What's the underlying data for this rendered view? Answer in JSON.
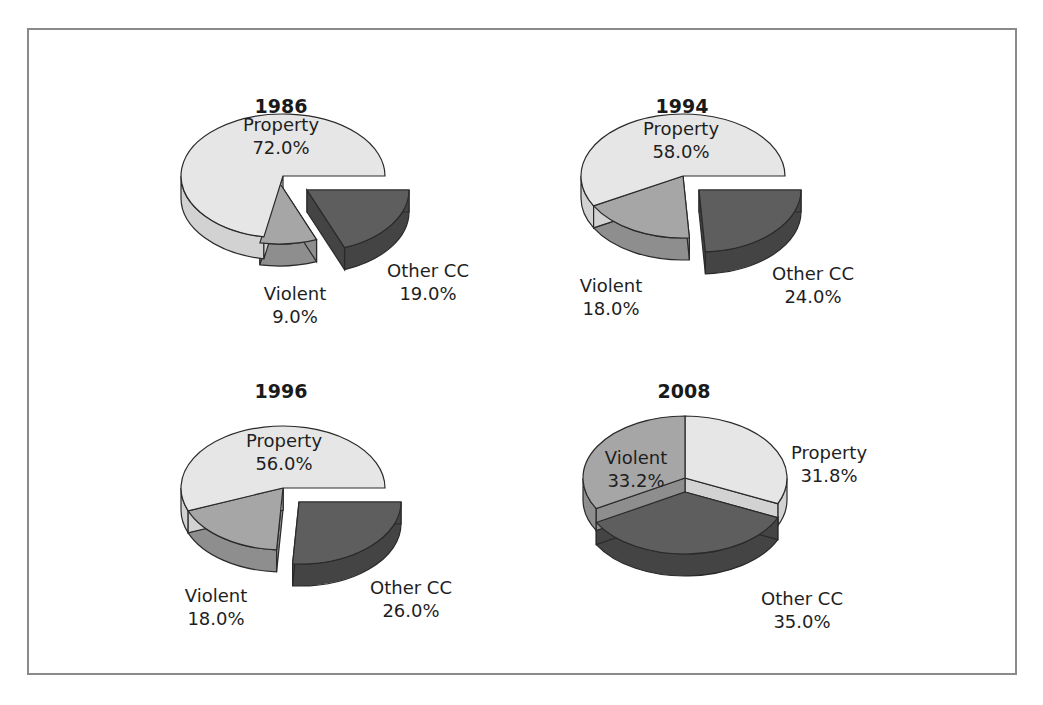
{
  "colors": {
    "property_top": "#e6e6e6",
    "property_side": "#d2d2d2",
    "violent_top": "#a6a6a6",
    "violent_side": "#8e8e8e",
    "other_top": "#5e5e5e",
    "other_side": "#444444",
    "outline": "#2a2a2a",
    "frame": "#8a8a8a"
  },
  "chart_data": [
    {
      "type": "pie",
      "title": "1986",
      "categories": [
        "Property",
        "Violent",
        "Other CC"
      ],
      "values": [
        72.0,
        9.0,
        19.0
      ],
      "labels": [
        "Property\n72.0%",
        "Violent\n9.0%",
        "Other CC\n19.0%"
      ],
      "exploded": [
        "Other CC"
      ],
      "style": "3d"
    },
    {
      "type": "pie",
      "title": "1994",
      "categories": [
        "Property",
        "Violent",
        "Other CC"
      ],
      "values": [
        58.0,
        18.0,
        24.0
      ],
      "labels": [
        "Property\n58.0%",
        "Violent\n18.0%",
        "Other CC\n24.0%"
      ],
      "exploded": [
        "Other CC"
      ],
      "style": "3d"
    },
    {
      "type": "pie",
      "title": "1996",
      "categories": [
        "Property",
        "Violent",
        "Other CC"
      ],
      "values": [
        56.0,
        18.0,
        26.0
      ],
      "labels": [
        "Property\n56.0%",
        "Violent\n18.0%",
        "Other CC\n26.0%"
      ],
      "exploded": [
        "Other CC"
      ],
      "style": "3d"
    },
    {
      "type": "pie",
      "title": "2008",
      "categories": [
        "Property",
        "Violent",
        "Other CC"
      ],
      "values": [
        31.8,
        33.2,
        35.0
      ],
      "labels": [
        "Property\n31.8%",
        "Violent\n33.2%",
        "Other CC\n35.0%"
      ],
      "exploded": [
        "Other CC"
      ],
      "style": "3d"
    }
  ],
  "charts": [
    {
      "title": "1986",
      "property": {
        "name": "Property",
        "pct": "72.0%"
      },
      "violent": {
        "name": "Violent",
        "pct": "9.0%"
      },
      "other": {
        "name": "Other CC",
        "pct": "19.0%"
      }
    },
    {
      "title": "1994",
      "property": {
        "name": "Property",
        "pct": "58.0%"
      },
      "violent": {
        "name": "Violent",
        "pct": "18.0%"
      },
      "other": {
        "name": "Other CC",
        "pct": "24.0%"
      }
    },
    {
      "title": "1996",
      "property": {
        "name": "Property",
        "pct": "56.0%"
      },
      "violent": {
        "name": "Violent",
        "pct": "18.0%"
      },
      "other": {
        "name": "Other CC",
        "pct": "26.0%"
      }
    },
    {
      "title": "2008",
      "property": {
        "name": "Property",
        "pct": "31.8%"
      },
      "violent": {
        "name": "Violent",
        "pct": "33.2%"
      },
      "other": {
        "name": "Other CC",
        "pct": "35.0%"
      }
    }
  ]
}
